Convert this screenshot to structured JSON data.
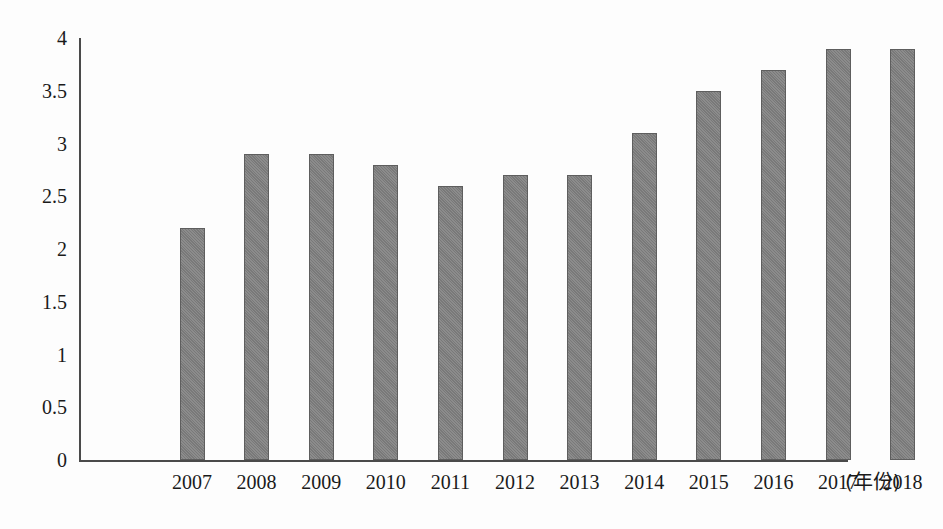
{
  "chart_data": {
    "type": "bar",
    "title": "",
    "subtitle": "",
    "xlabel": "(年份)",
    "ylabel": "",
    "categories": [
      "2007",
      "2008",
      "2009",
      "2010",
      "2011",
      "2012",
      "2013",
      "2014",
      "2015",
      "2016",
      "2017",
      "2018"
    ],
    "values": [
      2.2,
      2.9,
      2.9,
      2.8,
      2.6,
      2.7,
      2.7,
      3.1,
      3.5,
      3.7,
      3.9,
      3.9
    ],
    "ylim": [
      0,
      4
    ],
    "y_ticks": [
      "0",
      "0.5",
      "1",
      "1.5",
      "2",
      "2.5",
      "3",
      "3.5",
      "4"
    ],
    "y_tick_values": [
      0,
      0.5,
      1,
      1.5,
      2,
      2.5,
      3,
      3.5,
      4
    ],
    "grid": false,
    "legend": null,
    "legend_position": "none",
    "bar_color": "#7f7f7f",
    "bar_border_color": "#5e5e5e",
    "axis_color": "#4a4a4a",
    "background_color": "#fdfdfd"
  }
}
